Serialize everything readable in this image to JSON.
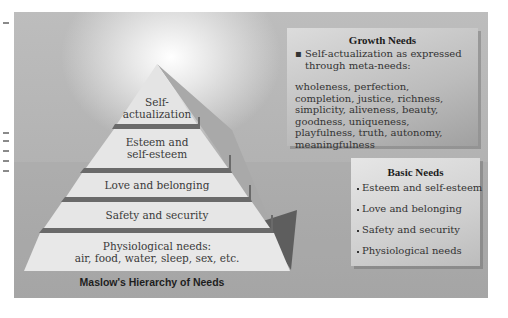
{
  "figure": {
    "title": "Maslow's Hierarchy of Needs",
    "colors": {
      "background": "#b8b8b8",
      "layer_fill": "#e3e3e3",
      "layer_divider": "#6a6a6a",
      "side_face": "#a6a6a6",
      "shadow_triangle": "#5c5c5c",
      "text": "#333333"
    }
  },
  "pyramid": {
    "layers": [
      {
        "label_line1": "Self-",
        "label_line2": "actualization"
      },
      {
        "label_line1": "Esteem and",
        "label_line2": "self-esteem"
      },
      {
        "label_line1": "Love and belonging",
        "label_line2": ""
      },
      {
        "label_line1": "Safety and security",
        "label_line2": ""
      },
      {
        "label_line1": "Physiological needs:",
        "label_line2": "air, food, water, sleep, sex, etc."
      }
    ]
  },
  "growth_needs": {
    "heading": "Growth Needs",
    "bullet": "Self-actualization as expressed through meta-needs:",
    "meta_needs": "wholeness, perfection, completion, justice, richness, simplicity, aliveness, beauty, goodness, uniqueness, playfulness, truth, autonomy, meaningfulness"
  },
  "basic_needs": {
    "heading": "Basic Needs",
    "items": [
      "Esteem and self-esteem",
      "Love and belonging",
      "Safety and security",
      "Physiological needs"
    ]
  }
}
